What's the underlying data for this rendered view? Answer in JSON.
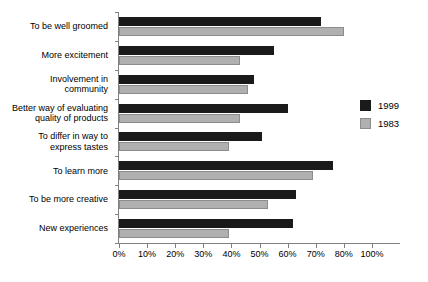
{
  "chart_data": {
    "type": "bar",
    "orientation": "horizontal",
    "title": "",
    "xlabel": "",
    "ylabel": "",
    "xlim": [
      0,
      100
    ],
    "grid": false,
    "legend_position": "right",
    "categories": [
      "To be well groomed",
      "More excitement",
      "Involvement in\ncommunity",
      "Better way of evaluating\nquality of products",
      "To differ in way to\nexpress tastes",
      "To learn more",
      "To be more creative",
      "New experiences"
    ],
    "series": [
      {
        "name": "1999",
        "color": "#1a1a1a",
        "values": [
          72,
          55,
          48,
          60,
          51,
          76,
          63,
          62
        ]
      },
      {
        "name": "1983",
        "color": "#b0b0b0",
        "values": [
          80,
          43,
          46,
          43,
          39,
          69,
          53,
          39
        ]
      }
    ],
    "xticks": [
      {
        "value": 0,
        "label": "0%"
      },
      {
        "value": 10,
        "label": "10%"
      },
      {
        "value": 20,
        "label": "20%"
      },
      {
        "value": 30,
        "label": "30%"
      },
      {
        "value": 40,
        "label": "40%"
      },
      {
        "value": 50,
        "label": "50%"
      },
      {
        "value": 60,
        "label": "60%"
      },
      {
        "value": 70,
        "label": "70%"
      },
      {
        "value": 80,
        "label": "80%"
      },
      {
        "value": 90,
        "label": "100%"
      }
    ]
  },
  "legend": {
    "items": [
      {
        "label": "1999"
      },
      {
        "label": "1983"
      }
    ]
  },
  "colors": {
    "series_1999": "#1a1a1a",
    "series_1983": "#b0b0b0",
    "axis": "#808080",
    "background": "#ffffff"
  }
}
